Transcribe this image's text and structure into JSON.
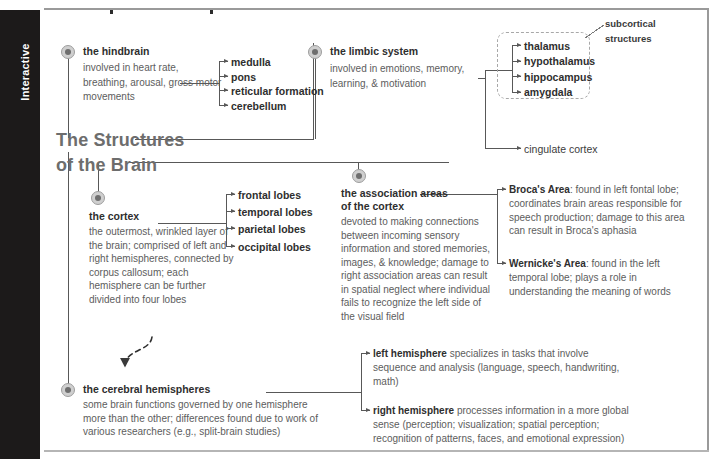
{
  "sidebar": {
    "label": "Interactive"
  },
  "title": {
    "line1": "The Structures",
    "line2": "of the Brain"
  },
  "nodes": {
    "hindbrain": {
      "heading": "the hindbrain",
      "body": "involved in heart rate, breathing, arousal, gross motor movements",
      "children": [
        "medulla",
        "pons",
        "reticular formation",
        "cerebellum"
      ]
    },
    "limbic": {
      "heading": "the limbic system",
      "body": "involved in emotions, memory, learning, & motivation",
      "children": [
        "thalamus",
        "hypothalamus",
        "hippocampus",
        "amygdala"
      ],
      "extra_child": "cingulate cortex",
      "group_caption": "subcortical structures"
    },
    "cortex": {
      "heading": "the cortex",
      "body": "the outermost, wrinkled layer of the brain; comprised of left and right hemispheres, connected by corpus callosum; each hemisphere can be further divided into four lobes",
      "children": [
        "frontal lobes",
        "temporal lobes",
        "parietal lobes",
        "occipital lobes"
      ]
    },
    "association": {
      "heading_line1": "the association areas",
      "heading_line2": "of the cortex",
      "body": "devoted to making connections between incoming sensory information and stored memories, images, & knowledge; damage to right association areas can result in spatial neglect where individual fails to recognize the left side of the visual field",
      "children": [
        {
          "term": "Broca's Area",
          "text": ": found in left fontal lobe; coordinates brain areas responsible for speech production; damage to this area can result in Broca's aphasia"
        },
        {
          "term": "Wernicke's Area",
          "text": ": found in the left temporal lobe; plays a role in understanding the meaning of words"
        }
      ]
    },
    "hemispheres": {
      "heading": "the cerebral hemispheres",
      "body": "some brain functions governed by one hemisphere more than the other; differences found due to work of various researchers (e.g., split-brain studies)",
      "children": [
        {
          "term": "left hemisphere",
          "text": " specializes in tasks that involve sequence and analysis (language, speech, handwriting, math)"
        },
        {
          "term": "right hemisphere",
          "text": " processes information in a more global sense (perception; visualization; spatial perception; recognition of patterns, faces, and emotional expression)"
        }
      ]
    }
  },
  "colors": {
    "sidebar_bg": "#1c1a1a",
    "heading_text": "#2e2e2e",
    "body_text": "#5d5d5d",
    "title_text": "#6d6d6d",
    "wire": "#585858",
    "node_dot": "#6e6e6e"
  }
}
